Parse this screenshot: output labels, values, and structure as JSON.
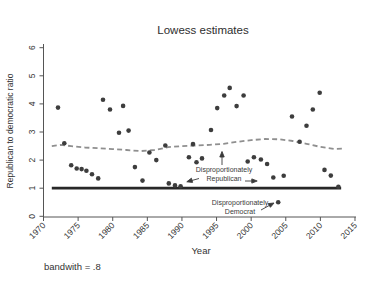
{
  "chart": {
    "title": "Lowess estimates",
    "xlabel": "Year",
    "ylabel": "Republican to democratic ratio",
    "note": "bandwith = .8",
    "annotations": {
      "republican": {
        "line1": "Disproportionately",
        "line2": "Republican"
      },
      "democrat": {
        "line1": "Disproportionately",
        "line2": "Democrat"
      }
    }
  },
  "chart_data": {
    "type": "scatter",
    "title": "Lowess estimates",
    "xlabel": "Year",
    "ylabel": "Republican to democratic ratio",
    "note": "bandwith = .8",
    "xlim": [
      1970,
      2015
    ],
    "ylim": [
      0,
      6
    ],
    "xticks": [
      1970,
      1975,
      1980,
      1985,
      1990,
      1995,
      2000,
      2005,
      2010,
      2015
    ],
    "yticks": [
      0,
      1,
      2,
      3,
      4,
      5,
      6
    ],
    "grid": false,
    "legend": "none",
    "points": [
      [
        1972.1,
        3.87
      ],
      [
        1973.0,
        2.6
      ],
      [
        1974.0,
        1.82
      ],
      [
        1974.8,
        1.7
      ],
      [
        1975.5,
        1.68
      ],
      [
        1976.2,
        1.62
      ],
      [
        1977.0,
        1.5
      ],
      [
        1977.9,
        1.35
      ],
      [
        1978.6,
        4.15
      ],
      [
        1979.6,
        3.8
      ],
      [
        1980.9,
        2.97
      ],
      [
        1981.5,
        3.93
      ],
      [
        1982.3,
        3.05
      ],
      [
        1983.2,
        1.75
      ],
      [
        1984.3,
        1.27
      ],
      [
        1985.3,
        2.27
      ],
      [
        1986.3,
        2.0
      ],
      [
        1987.6,
        2.52
      ],
      [
        1988.1,
        1.17
      ],
      [
        1989.0,
        1.1
      ],
      [
        1989.8,
        1.07
      ],
      [
        1991.0,
        2.1
      ],
      [
        1991.6,
        2.57
      ],
      [
        1992.1,
        1.92
      ],
      [
        1992.9,
        2.06
      ],
      [
        1994.2,
        3.07
      ],
      [
        1995.1,
        3.85
      ],
      [
        1996.1,
        4.3
      ],
      [
        1996.9,
        4.57
      ],
      [
        1997.9,
        3.92
      ],
      [
        1998.9,
        4.3
      ],
      [
        1999.5,
        1.95
      ],
      [
        2000.4,
        2.1
      ],
      [
        2001.4,
        2.02
      ],
      [
        2002.3,
        1.86
      ],
      [
        2003.2,
        1.38
      ],
      [
        2003.9,
        0.5
      ],
      [
        2004.7,
        1.44
      ],
      [
        2005.9,
        3.55
      ],
      [
        2007.0,
        2.65
      ],
      [
        2008.0,
        3.22
      ],
      [
        2008.9,
        3.8
      ],
      [
        2009.9,
        4.4
      ],
      [
        2010.6,
        1.65
      ],
      [
        2011.5,
        1.45
      ],
      [
        2012.6,
        1.05
      ]
    ],
    "lowess_line": [
      [
        1971.2,
        2.5
      ],
      [
        1972.5,
        2.54
      ],
      [
        1974.0,
        2.5
      ],
      [
        1976.0,
        2.45
      ],
      [
        1978.0,
        2.42
      ],
      [
        1980.0,
        2.39
      ],
      [
        1982.0,
        2.36
      ],
      [
        1984.0,
        2.32
      ],
      [
        1986.0,
        2.36
      ],
      [
        1988.0,
        2.46
      ],
      [
        1990.0,
        2.5
      ],
      [
        1992.0,
        2.52
      ],
      [
        1994.0,
        2.54
      ],
      [
        1996.0,
        2.58
      ],
      [
        1998.0,
        2.65
      ],
      [
        2000.0,
        2.71
      ],
      [
        2002.0,
        2.75
      ],
      [
        2004.0,
        2.74
      ],
      [
        2006.0,
        2.68
      ],
      [
        2008.0,
        2.58
      ],
      [
        2010.0,
        2.47
      ],
      [
        2012.0,
        2.4
      ],
      [
        2013.5,
        2.41
      ]
    ],
    "reference_line": {
      "y": 1,
      "x_start": 1971.2,
      "x_end": 2013.0
    },
    "annotation_targets": {
      "democrat_point": [
        2003.9,
        0.5
      ]
    },
    "colors": {
      "points": "#3d3d3d",
      "lowess": "#8f8f8f",
      "reference": "#282828",
      "axis": "#555555",
      "text": "#333333",
      "background": "#ffffff"
    }
  }
}
